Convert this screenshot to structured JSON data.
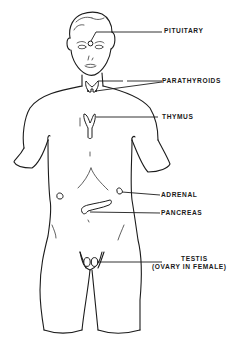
{
  "diagram": {
    "title": "",
    "labels": [
      {
        "id": "pituitary",
        "text": "PITUITARY"
      },
      {
        "id": "parathyroids",
        "text": "PARATHYROIDS"
      },
      {
        "id": "thymus",
        "text": "THYMUS"
      },
      {
        "id": "adrenal",
        "text": "ADRENAL"
      },
      {
        "id": "pancreas",
        "text": "PANCREAS"
      },
      {
        "id": "testis",
        "text": "TESTIS"
      },
      {
        "id": "ovary_note",
        "text": "(OVARY IN FEMALE)"
      }
    ],
    "colors": {
      "line": "#1c1c1c",
      "background": "#ffffff"
    }
  }
}
